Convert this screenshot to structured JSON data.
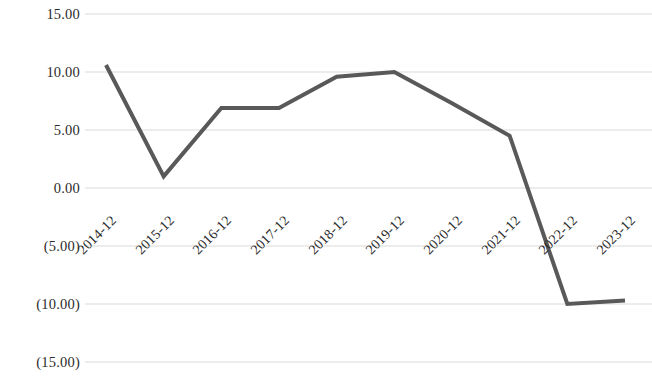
{
  "chart_data": {
    "type": "line",
    "title": "",
    "subtitle": "",
    "xlabel": "",
    "ylabel": "",
    "categories": [
      "2014-12",
      "2015-12",
      "2016-12",
      "2017-12",
      "2018-12",
      "2019-12",
      "2020-12",
      "2021-12",
      "2022-12",
      "2023-12"
    ],
    "series": [
      {
        "name": "series-1",
        "color": "#595959",
        "values": [
          10.6,
          1.0,
          6.9,
          6.9,
          9.6,
          10.0,
          7.3,
          4.5,
          -10.0,
          -9.7
        ]
      }
    ],
    "ylim": [
      -15.0,
      15.0
    ],
    "ytick_values": [
      15.0,
      10.0,
      5.0,
      0.0,
      -5.0,
      -10.0,
      -15.0
    ],
    "ytick_labels": [
      "15.00",
      "10.00",
      "5.00",
      "0.00",
      "(5.00)",
      "(10.00)",
      "(15.00)"
    ],
    "grid": true,
    "grid_axis": "y",
    "grid_color": "#d9d9d9",
    "legend": "none",
    "legend_position": "none",
    "axis_line": false,
    "markers": false,
    "line_width": 4,
    "xtick_rotation": -45,
    "annotations": []
  },
  "style": {
    "background": "#ffffff",
    "text_color": "#2b2b2b",
    "line_color": "#595959",
    "grid_color": "#d9d9d9"
  }
}
